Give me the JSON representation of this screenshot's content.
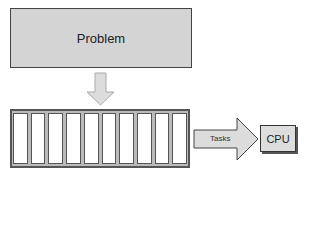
{
  "problem": {
    "label": "Problem"
  },
  "queue": {
    "cells": 10
  },
  "arrow": {
    "label": "Tasks"
  },
  "cpu": {
    "label": "CPU"
  },
  "colors": {
    "box_fill": "#d4d4d4",
    "arrow_fill": "#dcdcdc",
    "stroke": "#444444"
  }
}
